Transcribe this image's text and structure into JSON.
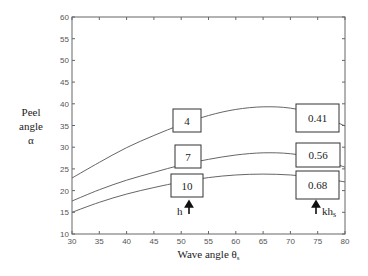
{
  "chart_data": {
    "type": "line",
    "title": "",
    "xlabel": "Wave angle θs",
    "xlabel_main": "Wave angle θ",
    "xlabel_sub": "s",
    "ylabel_lines": [
      "Peel",
      "angle",
      "α"
    ],
    "xlim": [
      30,
      80
    ],
    "ylim": [
      10,
      60
    ],
    "xticks": [
      30,
      35,
      40,
      45,
      50,
      55,
      60,
      65,
      70,
      75,
      80
    ],
    "yticks": [
      10,
      15,
      20,
      25,
      30,
      35,
      40,
      45,
      50,
      55,
      60
    ],
    "grid": false,
    "legend": "none",
    "x": [
      30,
      35,
      40,
      45,
      50,
      55,
      60,
      65,
      70,
      75,
      80
    ],
    "series": [
      {
        "name": "h=4, khs=0.41",
        "h": "4",
        "khs": "0.41",
        "values": [
          22.9,
          26.5,
          29.9,
          32.7,
          35.2,
          37.3,
          38.7,
          39.3,
          39.0,
          37.5,
          34.9
        ]
      },
      {
        "name": "h=7, khs=0.56",
        "h": "7",
        "khs": "0.56",
        "values": [
          17.6,
          20.2,
          22.4,
          24.2,
          25.9,
          27.2,
          28.2,
          28.7,
          28.5,
          27.4,
          25.4
        ]
      },
      {
        "name": "h=10, khs=0.68",
        "h": "10",
        "khs": "0.68",
        "values": [
          15.0,
          17.3,
          19.2,
          20.7,
          22.0,
          23.0,
          23.6,
          23.8,
          23.6,
          23.0,
          22.0
        ]
      }
    ],
    "annotations": {
      "h_label": "h",
      "h_sub": "",
      "khs_label_main": "kh",
      "khs_label_sub": "s",
      "h_boxes": [
        "4",
        "7",
        "10"
      ],
      "khs_boxes": [
        "0.41",
        "0.56",
        "0.68"
      ]
    }
  }
}
